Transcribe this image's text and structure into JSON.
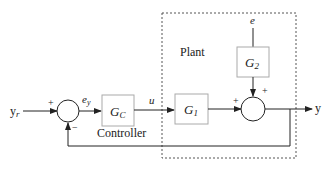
{
  "diagram": {
    "type": "control-system-block-diagram",
    "signals": {
      "reference": "y",
      "reference_sub": "r",
      "error": "e",
      "error_sub": "y",
      "control": "u",
      "disturbance": "e",
      "output": "y"
    },
    "blocks": {
      "controller": {
        "symbol": "G",
        "sub": "C",
        "caption": "Controller"
      },
      "g1": {
        "symbol": "G",
        "sub": "1"
      },
      "g2": {
        "symbol": "G",
        "sub": "2"
      }
    },
    "plant_label": "Plant",
    "signs": {
      "sum1_ref": "+",
      "sum1_feedback": "−",
      "sum2_left": "+",
      "sum2_top": "+"
    },
    "colors": {
      "line": "#222222",
      "block_border": "#aaaaaa",
      "dashed": "#555555"
    }
  }
}
